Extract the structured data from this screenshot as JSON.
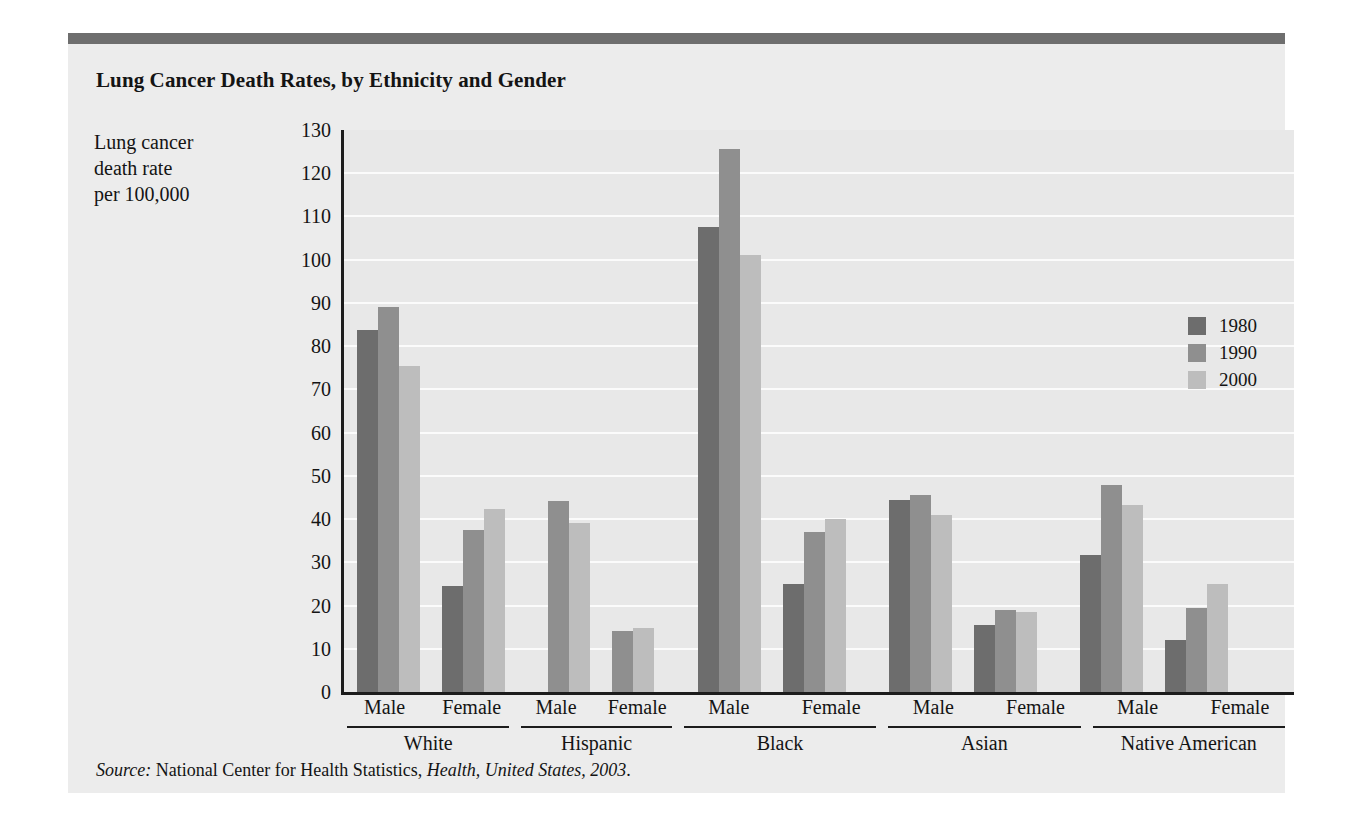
{
  "figure": {
    "title": "Lung Cancer Death Rates, by Ethnicity and Gender",
    "y_caption_line1": "Lung cancer",
    "y_caption_line2": "death rate",
    "y_caption_line3": "per 100,000",
    "source_prefix": "Source:",
    "source_body": " National Center for Health Statistics, ",
    "source_italic": "Health, United States, 2003",
    "source_suffix": "."
  },
  "colors": {
    "y1980": "#6d6d6d",
    "y1990": "#8f8f8f",
    "y2000": "#bdbdbd",
    "panel": "#ececec",
    "plot": "#e8e8e8",
    "rule": "#6e6e6e",
    "axis": "#1c1c1c"
  },
  "legend": {
    "position": "inside-right",
    "items": [
      {
        "label": "1980",
        "color": "#6d6d6d"
      },
      {
        "label": "1990",
        "color": "#8f8f8f"
      },
      {
        "label": "2000",
        "color": "#bdbdbd"
      }
    ]
  },
  "chart_data": {
    "type": "bar",
    "title": "Lung Cancer Death Rates, by Ethnicity and Gender",
    "xlabel": "",
    "ylabel": "Lung cancer death rate per 100,000",
    "ylim": [
      0,
      130
    ],
    "ytick_step": 10,
    "yticks": [
      0,
      10,
      20,
      30,
      40,
      50,
      60,
      70,
      80,
      90,
      100,
      110,
      120,
      130
    ],
    "ytick_labels": [
      "0",
      "10",
      "20",
      "30",
      "40",
      "50",
      "60",
      "70",
      "80",
      "90",
      "100",
      "110",
      "120",
      "130"
    ],
    "grid": true,
    "legend_position": "inside-right",
    "series_names": [
      "1980",
      "1990",
      "2000"
    ],
    "categories": [
      "White Male",
      "White Female",
      "Hispanic Male",
      "Hispanic Female",
      "Black Male",
      "Black Female",
      "Asian Male",
      "Asian Female",
      "Native American Male",
      "Native American Female"
    ],
    "series": [
      {
        "name": "1980",
        "color": "#6d6d6d",
        "values": [
          83.8,
          24.5,
          null,
          null,
          107.5,
          25.0,
          44.5,
          15.5,
          31.8,
          12.0
        ]
      },
      {
        "name": "1990",
        "color": "#8f8f8f",
        "values": [
          89.0,
          37.5,
          44.2,
          14.0,
          125.5,
          37.0,
          45.5,
          19.0,
          47.8,
          19.5
        ]
      },
      {
        "name": "2000",
        "color": "#bdbdbd",
        "values": [
          75.5,
          42.3,
          39.0,
          14.8,
          101.0,
          40.0,
          41.0,
          18.5,
          43.3,
          25.0
        ]
      }
    ],
    "groups": [
      {
        "ethnicity": "White",
        "genders": [
          {
            "gender": "Male",
            "bars": [
              {
                "year": "1980",
                "value": 83.8
              },
              {
                "year": "1990",
                "value": 89.0
              },
              {
                "year": "2000",
                "value": 75.5
              }
            ]
          },
          {
            "gender": "Female",
            "bars": [
              {
                "year": "1980",
                "value": 24.5
              },
              {
                "year": "1990",
                "value": 37.5
              },
              {
                "year": "2000",
                "value": 42.3
              }
            ]
          }
        ]
      },
      {
        "ethnicity": "Hispanic",
        "genders": [
          {
            "gender": "Male",
            "bars": [
              {
                "year": "1990",
                "value": 44.2
              },
              {
                "year": "2000",
                "value": 39.0
              }
            ]
          },
          {
            "gender": "Female",
            "bars": [
              {
                "year": "1990",
                "value": 14.0
              },
              {
                "year": "2000",
                "value": 14.8
              }
            ]
          }
        ]
      },
      {
        "ethnicity": "Black",
        "genders": [
          {
            "gender": "Male",
            "bars": [
              {
                "year": "1980",
                "value": 107.5
              },
              {
                "year": "1990",
                "value": 125.5
              },
              {
                "year": "2000",
                "value": 101.0
              }
            ]
          },
          {
            "gender": "Female",
            "bars": [
              {
                "year": "1980",
                "value": 25.0
              },
              {
                "year": "1990",
                "value": 37.0
              },
              {
                "year": "2000",
                "value": 40.0
              }
            ]
          }
        ]
      },
      {
        "ethnicity": "Asian",
        "genders": [
          {
            "gender": "Male",
            "bars": [
              {
                "year": "1980",
                "value": 44.5
              },
              {
                "year": "1990",
                "value": 45.5
              },
              {
                "year": "2000",
                "value": 41.0
              }
            ]
          },
          {
            "gender": "Female",
            "bars": [
              {
                "year": "1980",
                "value": 15.5
              },
              {
                "year": "1990",
                "value": 19.0
              },
              {
                "year": "2000",
                "value": 18.5
              }
            ]
          }
        ]
      },
      {
        "ethnicity": "Native American",
        "genders": [
          {
            "gender": "Male",
            "bars": [
              {
                "year": "1980",
                "value": 31.8
              },
              {
                "year": "1990",
                "value": 47.8
              },
              {
                "year": "2000",
                "value": 43.3
              }
            ]
          },
          {
            "gender": "Female",
            "bars": [
              {
                "year": "1980",
                "value": 12.0
              },
              {
                "year": "1990",
                "value": 19.5
              },
              {
                "year": "2000",
                "value": 25.0
              }
            ]
          }
        ]
      }
    ]
  }
}
